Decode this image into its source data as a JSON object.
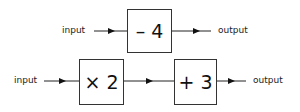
{
  "diagram": {
    "row1": {
      "input_label": "input",
      "operation": "– 4",
      "output_label": "output"
    },
    "row2": {
      "input_label": "input",
      "operation1": "× 2",
      "operation2": "+ 3",
      "output_label": "output"
    }
  }
}
